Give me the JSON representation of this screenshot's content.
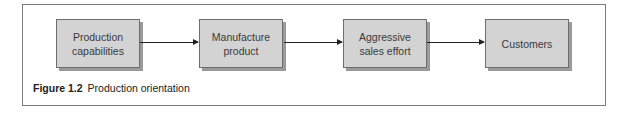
{
  "figure": {
    "number": "Figure 1.2",
    "title": "Production orientation"
  },
  "nodes": [
    {
      "id": "production-capabilities",
      "label": "Production capabilities",
      "lines": [
        "Production",
        "capabilities"
      ]
    },
    {
      "id": "manufacture-product",
      "label": "Manufacture product",
      "lines": [
        "Manufacture",
        "product"
      ]
    },
    {
      "id": "aggressive-sales-effort",
      "label": "Aggressive sales effort",
      "lines": [
        "Aggressive",
        "sales effort"
      ]
    },
    {
      "id": "customers",
      "label": "Customers",
      "lines": [
        "Customers"
      ]
    }
  ],
  "edges": [
    {
      "from": "production-capabilities",
      "to": "manufacture-product"
    },
    {
      "from": "manufacture-product",
      "to": "aggressive-sales-effort"
    },
    {
      "from": "aggressive-sales-effort",
      "to": "customers"
    }
  ],
  "colors": {
    "box_fill": "#d3d3d3",
    "box_border": "#6e6e6e",
    "shadow": "#9a9a9a",
    "frame": "#7a7a7a"
  }
}
